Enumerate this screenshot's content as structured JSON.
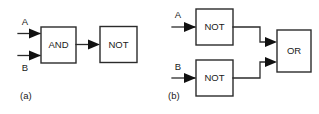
{
  "figure": {
    "width": 319,
    "height": 114,
    "background": "#ffffff",
    "line_color": "#2b2b2b",
    "text_color": "#1a1a1a"
  },
  "circuits": [
    {
      "caption": "(a)",
      "inputs": [
        {
          "label": "A"
        },
        {
          "label": "B"
        }
      ],
      "gates": [
        {
          "label": "AND"
        },
        {
          "label": "NOT"
        }
      ]
    },
    {
      "caption": "(b)",
      "inputs": [
        {
          "label": "A"
        },
        {
          "label": "B"
        }
      ],
      "gates": [
        {
          "label": "NOT"
        },
        {
          "label": "NOT"
        },
        {
          "label": "OR"
        }
      ]
    }
  ]
}
